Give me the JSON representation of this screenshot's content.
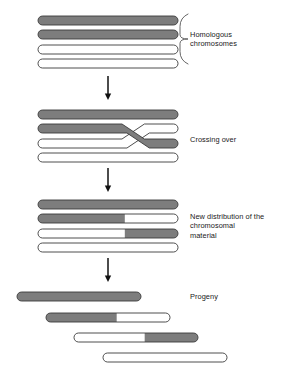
{
  "figure": {
    "background_color": "#ffffff",
    "chromosome_fill_gray": "#7d7d7d",
    "chromosome_fill_white": "#ffffff",
    "chromosome_outline_color": "#3a3a3a",
    "arrow_color": "#111111",
    "brace_color": "#555555",
    "text_color": "#1a1a1a"
  },
  "stages": [
    {
      "id": "homologous-chromosomes",
      "label": "Homologous\nchromosomes",
      "label_x": 190,
      "label_y": 30,
      "has_brace": true,
      "brace": {
        "x": 180,
        "y_top": 14,
        "y_bottom": 64,
        "tip_x": 188
      },
      "rows": [
        {
          "x": 38,
          "y": 16,
          "width": 140,
          "height": 9,
          "segments": [
            {
              "fill": "gray",
              "fraction": 1
            }
          ]
        },
        {
          "x": 38,
          "y": 30,
          "width": 140,
          "height": 9,
          "segments": [
            {
              "fill": "gray",
              "fraction": 1
            }
          ]
        },
        {
          "x": 38,
          "y": 45,
          "width": 140,
          "height": 9,
          "segments": [
            {
              "fill": "white",
              "fraction": 1
            }
          ]
        },
        {
          "x": 38,
          "y": 59,
          "width": 140,
          "height": 9,
          "segments": [
            {
              "fill": "white",
              "fraction": 1
            }
          ]
        }
      ]
    },
    {
      "id": "crossing-over",
      "label": "Crossing over",
      "label_x": 190,
      "label_y": 135,
      "has_brace": false,
      "rows": [
        {
          "x": 38,
          "y": 110,
          "width": 140,
          "height": 9,
          "segments": [
            {
              "fill": "gray",
              "fraction": 1
            }
          ]
        },
        {
          "x": 38,
          "y": 124,
          "width": 140,
          "height": 9,
          "crossing": "gray-down"
        },
        {
          "x": 38,
          "y": 139,
          "width": 140,
          "height": 9,
          "crossing": "white-up"
        },
        {
          "x": 38,
          "y": 153,
          "width": 140,
          "height": 9,
          "segments": [
            {
              "fill": "white",
              "fraction": 1
            }
          ]
        }
      ]
    },
    {
      "id": "new-distribution",
      "label": "New distribution of the\nchromosomal\nmaterial",
      "label_x": 190,
      "label_y": 212,
      "has_brace": false,
      "rows": [
        {
          "x": 38,
          "y": 200,
          "width": 140,
          "height": 9,
          "segments": [
            {
              "fill": "gray",
              "fraction": 1
            }
          ]
        },
        {
          "x": 38,
          "y": 214,
          "width": 140,
          "height": 9,
          "segments": [
            {
              "fill": "gray",
              "fraction": 0.62
            },
            {
              "fill": "white",
              "fraction": 0.38
            }
          ]
        },
        {
          "x": 38,
          "y": 229,
          "width": 140,
          "height": 9,
          "segments": [
            {
              "fill": "white",
              "fraction": 0.62
            },
            {
              "fill": "gray",
              "fraction": 0.38
            }
          ]
        },
        {
          "x": 38,
          "y": 243,
          "width": 140,
          "height": 9,
          "segments": [
            {
              "fill": "white",
              "fraction": 1
            }
          ]
        }
      ]
    },
    {
      "id": "progeny",
      "label": "Progeny",
      "label_x": 190,
      "label_y": 292,
      "has_brace": false,
      "rows": [
        {
          "x": 17,
          "y": 292,
          "width": 124,
          "height": 9,
          "segments": [
            {
              "fill": "gray",
              "fraction": 1
            }
          ]
        },
        {
          "x": 46,
          "y": 313,
          "width": 124,
          "height": 9,
          "segments": [
            {
              "fill": "gray",
              "fraction": 0.57
            },
            {
              "fill": "white",
              "fraction": 0.43
            }
          ]
        },
        {
          "x": 74,
          "y": 333,
          "width": 124,
          "height": 9,
          "segments": [
            {
              "fill": "white",
              "fraction": 0.57
            },
            {
              "fill": "gray",
              "fraction": 0.43
            }
          ]
        },
        {
          "x": 103,
          "y": 353,
          "width": 124,
          "height": 9,
          "segments": [
            {
              "fill": "white",
              "fraction": 1
            }
          ]
        }
      ]
    }
  ],
  "arrows": [
    {
      "id": "arrow-1",
      "x": 108,
      "y_start": 76,
      "y_end": 100
    },
    {
      "id": "arrow-2",
      "x": 108,
      "y_start": 168,
      "y_end": 192
    },
    {
      "id": "arrow-3",
      "x": 108,
      "y_start": 258,
      "y_end": 282
    }
  ]
}
